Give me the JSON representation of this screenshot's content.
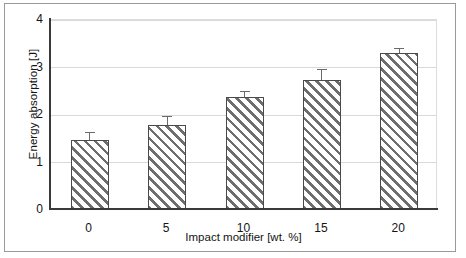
{
  "chart_data": {
    "type": "bar",
    "title": "",
    "xlabel": "Impact modifier [wt. %]",
    "ylabel": "Energy absorption [J]",
    "categories": [
      "0",
      "5",
      "10",
      "15",
      "20"
    ],
    "values": [
      1.47,
      1.79,
      2.38,
      2.74,
      3.31
    ],
    "errors": [
      0.17,
      0.19,
      0.13,
      0.23,
      0.11
    ],
    "ylim": [
      0,
      4
    ],
    "yticks": [
      "0",
      "1",
      "2",
      "3",
      "4"
    ],
    "ytick_values": [
      0,
      1,
      2,
      3,
      4
    ],
    "grid": "horizontal",
    "legend": "none",
    "series_name": "Energy absorption",
    "bar_fill": "diagonal-hatch",
    "colors": {
      "bar_edge": "#4a4a4a",
      "bar_hatch": "#6e6e6e",
      "bar_background": "#ffffff",
      "gridline": "#d9d9d9",
      "axis": "#3a3a3a",
      "text": "#141414",
      "frame": "#9a9a9a",
      "plot_background": "#ffffff"
    }
  }
}
